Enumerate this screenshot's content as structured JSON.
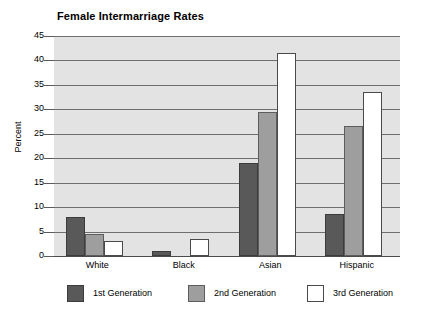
{
  "chart_data": {
    "type": "bar",
    "title": "Female Intermarriage Rates",
    "xlabel": "",
    "ylabel": "Percent",
    "ylim": [
      0,
      45
    ],
    "yticks": [
      0,
      5,
      10,
      15,
      20,
      25,
      30,
      35,
      40,
      45
    ],
    "grid": true,
    "legend_position": "bottom",
    "categories": [
      "White",
      "Black",
      "Asian",
      "Hispanic"
    ],
    "series": [
      {
        "name": "1st Generation",
        "color": "#595959",
        "values": [
          8.0,
          1.0,
          19.0,
          8.5
        ]
      },
      {
        "name": "2nd Generation",
        "color": "#9e9e9e",
        "values": [
          4.5,
          0.0,
          29.5,
          26.5
        ]
      },
      {
        "name": "3rd Generation",
        "color": "#ffffff",
        "values": [
          3.0,
          3.5,
          41.5,
          33.5
        ]
      }
    ]
  },
  "axis": {
    "y_label": "Percent",
    "y_tick_labels": [
      "45",
      "40",
      "35",
      "30",
      "25",
      "20",
      "15",
      "10",
      "5",
      "0"
    ]
  },
  "legend": {
    "items": [
      {
        "label": "1st Generation"
      },
      {
        "label": "2nd Generation"
      },
      {
        "label": "3rd Generation"
      }
    ]
  }
}
